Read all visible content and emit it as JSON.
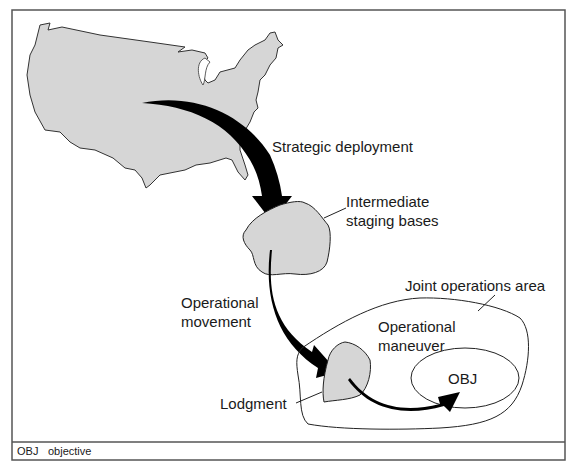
{
  "diagram": {
    "labels": {
      "strategic_deployment": "Strategic deployment",
      "isb_line1": "Intermediate",
      "isb_line2": "staging bases",
      "op_movement_line1": "Operational",
      "op_movement_line2": "movement",
      "joa": "Joint operations area",
      "op_maneuver_line1": "Operational",
      "op_maneuver_line2": "maneuver",
      "lodgment": "Lodgment",
      "objective": "OBJ"
    },
    "legend": {
      "abbr": "OBJ",
      "meaning": "objective"
    },
    "colors": {
      "land_fill": "#d6d6d6",
      "outline": "#333333",
      "arrow": "#000000",
      "frame": "#555555"
    }
  }
}
